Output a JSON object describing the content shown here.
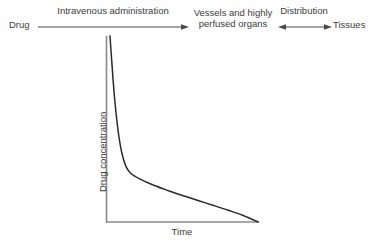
{
  "figure": {
    "background_color": "#fefefe",
    "line_color": "#2a2a2a",
    "axis_color": "#808080",
    "text_color": "#3d3d3d"
  },
  "flow": {
    "source_label": "Drug",
    "middle_label": "Vessels and highly perfused organs",
    "target_label": "Tissues",
    "arrows": [
      {
        "name": "intravenous-administration-arrow",
        "caption": "Intravenous administration",
        "direction": "right"
      },
      {
        "name": "distribution-arrow",
        "caption": "Distribution",
        "direction": "both"
      }
    ]
  },
  "chart_data": {
    "type": "line",
    "title": "",
    "xlabel": "Time",
    "ylabel": "Drug concentration",
    "grid": false,
    "legend": null,
    "axis_ticks": {
      "x": [],
      "y": []
    },
    "xlim": [
      0,
      1
    ],
    "ylim": [
      0,
      1
    ],
    "annotations": [
      "biexponential plasma concentration decline",
      "steep distribution (alpha) phase",
      "shallow elimination (beta) phase"
    ],
    "series": [
      {
        "name": "Plasma drug concentration",
        "description": "Biexponential decline after intravenous bolus",
        "x": [
          0.0,
          0.01,
          0.02,
          0.03,
          0.05,
          0.07,
          0.09,
          0.11,
          0.14,
          0.2,
          0.3,
          0.4,
          0.5,
          0.6,
          0.7,
          0.8,
          0.9,
          1.0
        ],
        "y": [
          1.0,
          0.885,
          0.775,
          0.675,
          0.52,
          0.41,
          0.34,
          0.295,
          0.262,
          0.232,
          0.196,
          0.167,
          0.14,
          0.114,
          0.089,
          0.063,
          0.035,
          0.0
        ]
      }
    ]
  }
}
